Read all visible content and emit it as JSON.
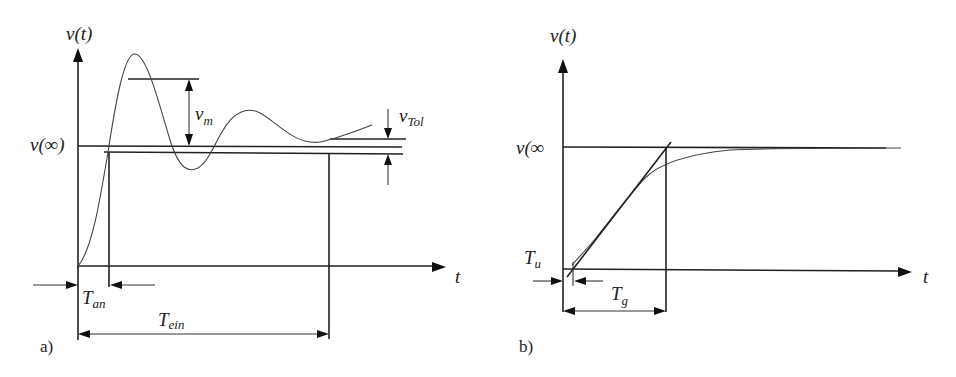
{
  "panels": {
    "a": {
      "tag": "a)",
      "y_axis_label": "v(t)",
      "x_axis_label": "t",
      "steady_state_label": "v(∞)",
      "overshoot_label": {
        "main": "v",
        "sub": "m"
      },
      "tolerance_label": {
        "main": "v",
        "sub": "Tol"
      },
      "rise_time_label": {
        "main": "T",
        "sub": "an"
      },
      "settling_time_label": {
        "main": "T",
        "sub": "ein"
      }
    },
    "b": {
      "tag": "b)",
      "y_axis_label": "v(t)",
      "x_axis_label": "t",
      "steady_state_label": "v(∞",
      "dead_time_label": {
        "main": "T",
        "sub": "u"
      },
      "compensation_time_label": {
        "main": "T",
        "sub": "g"
      }
    }
  },
  "colors": {
    "ink": "#222222",
    "background": "#ffffff"
  }
}
